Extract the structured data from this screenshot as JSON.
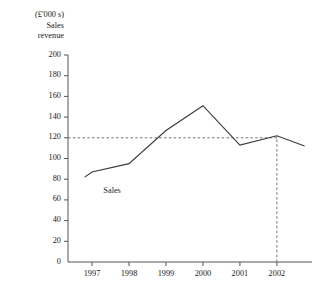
{
  "chart_data": {
    "type": "line",
    "title": "",
    "ylabel_lines": [
      "(£'000 s)",
      "Sales",
      "revenue"
    ],
    "xlabel": "",
    "categories": [
      "1997",
      "1998",
      "1999",
      "2000",
      "2001",
      "2002"
    ],
    "x": [
      1997,
      1998,
      1999,
      2000,
      2001,
      2002
    ],
    "series": [
      {
        "name": "Sales",
        "values": [
          87,
          95,
          127,
          151,
          113,
          122
        ]
      }
    ],
    "line_extends_before_first_point": {
      "x": 1996.8,
      "value": 82
    },
    "line_extends_after_last_point": {
      "x": 2002.75,
      "value": 112
    },
    "ylim": [
      0,
      200
    ],
    "ytick_labels": [
      "0",
      "20",
      "40",
      "60",
      "80",
      "100",
      "120",
      "140",
      "160",
      "180",
      "200"
    ],
    "ytick_values": [
      0,
      20,
      40,
      60,
      80,
      100,
      120,
      140,
      160,
      180,
      200
    ],
    "xlim": [
      1996.35,
      2002.95
    ],
    "grid": false,
    "legend": "none",
    "annotations": [
      {
        "text": "Sales",
        "x": 1996.9,
        "value": 68
      }
    ],
    "reference_lines": [
      {
        "orientation": "horizontal",
        "value": 120,
        "style": "dashed",
        "from_x": 1996.35,
        "to_x": 2002
      },
      {
        "orientation": "vertical",
        "value": 2002,
        "style": "dashed",
        "from_y": 0,
        "to_y": 122
      }
    ],
    "colors": {
      "line": "#3a3a3a",
      "axis": "#555555",
      "dashed": "#777777",
      "text": "#1a1a1a",
      "background": "#ffffff"
    }
  }
}
